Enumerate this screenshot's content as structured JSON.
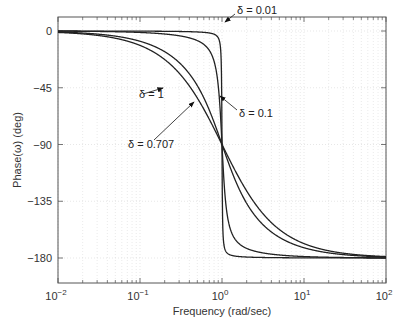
{
  "chart_data": {
    "type": "line",
    "title": "",
    "xlabel": "Frequency (rad/sec)",
    "ylabel": "Phase(ω) (deg)",
    "xscale": "log",
    "xlim": [
      0.01,
      100
    ],
    "ylim": [
      -200,
      10
    ],
    "x_ticks": [
      {
        "value": 0.01,
        "base": "10",
        "exp": "-2"
      },
      {
        "value": 0.1,
        "base": "10",
        "exp": "-1"
      },
      {
        "value": 1,
        "base": "10",
        "exp": "0"
      },
      {
        "value": 10,
        "base": "10",
        "exp": "1"
      },
      {
        "value": 100,
        "base": "10",
        "exp": "2"
      }
    ],
    "y_ticks": [
      0,
      -45,
      -90,
      -135,
      -180
    ],
    "y_tick_labels": [
      "0",
      "-45",
      "-90",
      "-135",
      "-180"
    ],
    "grid": true,
    "series": [
      {
        "name": "δ = 0.01",
        "damping": 0.01
      },
      {
        "name": "δ = 0.1",
        "damping": 0.1
      },
      {
        "name": "δ = 0.707",
        "damping": 0.707
      },
      {
        "name": "δ = 1",
        "damping": 1
      }
    ],
    "annotations": [
      {
        "text": "δ = 0.01",
        "series": 0,
        "arrow_to_x": 1.0,
        "arrow_to_y": -10
      },
      {
        "text": "δ = 0.1",
        "series": 1,
        "arrow_to_x": 0.96,
        "arrow_to_y": -35
      },
      {
        "text": "δ = 1",
        "series": 3,
        "arrow_to_x": 0.5,
        "arrow_to_y": -12
      },
      {
        "text": "δ = 0.707",
        "series": 2,
        "arrow_to_x": 0.6,
        "arrow_to_y": -30
      }
    ],
    "line_color": "#222222",
    "grid_color": "#dcdcdc"
  }
}
